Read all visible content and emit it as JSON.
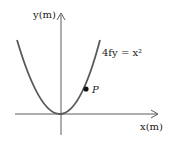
{
  "diagram": {
    "y_axis_label": "y(m)",
    "x_axis_label": "x(m)",
    "equation": "4fy = x²",
    "point_label": "P",
    "curve_color": "#5a5a5a",
    "axis_color": "#333333"
  }
}
